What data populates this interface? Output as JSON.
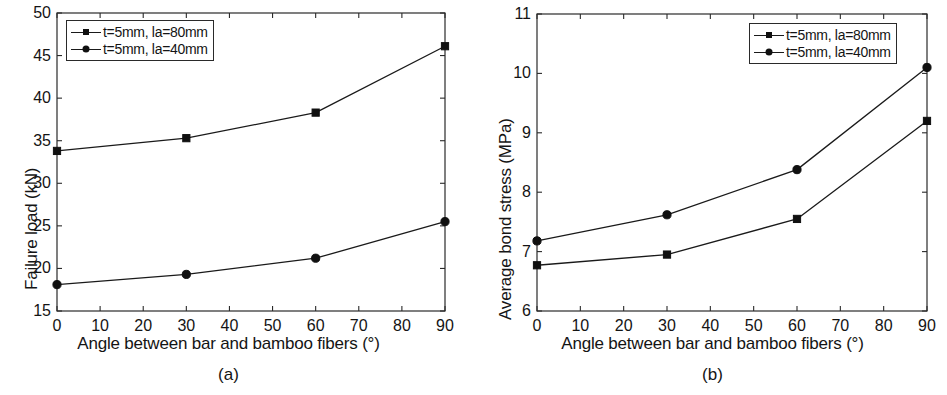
{
  "chart_data": [
    {
      "panel": "(a)",
      "type": "line",
      "title": "",
      "xlabel": "Angle between bar and bamboo fibers (°)",
      "ylabel": "Failure load (kN)",
      "x": [
        0,
        30,
        60,
        90
      ],
      "xlim": [
        0,
        90
      ],
      "ylim": [
        15,
        50
      ],
      "xticks": [
        0,
        10,
        20,
        30,
        40,
        50,
        60,
        70,
        80,
        90
      ],
      "yticks": [
        15,
        20,
        25,
        30,
        35,
        40,
        45,
        50
      ],
      "grid": false,
      "legend_position": "top-left",
      "series": [
        {
          "name": "t=5mm, la=80mm",
          "marker": "square",
          "values": [
            33.8,
            35.3,
            38.3,
            46.1
          ]
        },
        {
          "name": "t=5mm, la=40mm",
          "marker": "circle",
          "values": [
            18.1,
            19.3,
            21.2,
            25.5
          ]
        }
      ]
    },
    {
      "panel": "(b)",
      "type": "line",
      "title": "",
      "xlabel": "Angle between bar and bamboo fibers (°)",
      "ylabel": "Average bond stress (MPa)",
      "x": [
        0,
        30,
        60,
        90
      ],
      "xlim": [
        0,
        90
      ],
      "ylim": [
        6,
        11
      ],
      "xticks": [
        0,
        10,
        20,
        30,
        40,
        50,
        60,
        70,
        80,
        90
      ],
      "yticks": [
        6,
        7,
        8,
        9,
        10,
        11
      ],
      "grid": false,
      "legend_position": "top-right",
      "series": [
        {
          "name": "t=5mm, la=80mm",
          "marker": "square",
          "values": [
            6.77,
            6.95,
            7.55,
            9.2
          ]
        },
        {
          "name": "t=5mm, la=40mm",
          "marker": "circle",
          "values": [
            7.18,
            7.62,
            8.38,
            10.1
          ]
        }
      ]
    }
  ],
  "panel_a": {
    "caption": "(a)",
    "ylabel": "Failure load (kN)",
    "xlabel": "Angle between bar and bamboo fibers (°)",
    "yticks": [
      "50",
      "45",
      "40",
      "35",
      "30",
      "25",
      "20",
      "15"
    ],
    "xticks": [
      "0",
      "10",
      "20",
      "30",
      "40",
      "50",
      "60",
      "70",
      "80",
      "90"
    ],
    "legend": [
      {
        "label": "t=5mm, la=80mm",
        "marker": "square-marker"
      },
      {
        "label": "t=5mm, la=40mm",
        "marker": "circle-marker"
      }
    ]
  },
  "panel_b": {
    "caption": "(b)",
    "ylabel": "Average bond stress (MPa)",
    "xlabel": "Angle between bar and bamboo fibers (°)",
    "yticks": [
      "11",
      "10",
      "9",
      "8",
      "7",
      "6"
    ],
    "xticks": [
      "0",
      "10",
      "20",
      "30",
      "40",
      "50",
      "60",
      "70",
      "80",
      "90"
    ],
    "legend": [
      {
        "label": "t=5mm, la=80mm",
        "marker": "square-marker"
      },
      {
        "label": "t=5mm, la=40mm",
        "marker": "circle-marker"
      }
    ]
  },
  "style": {
    "line_color": "#1a1a1a",
    "marker_color": "#101010",
    "axis_color": "#2a2a2a",
    "background": "#ffffff"
  }
}
